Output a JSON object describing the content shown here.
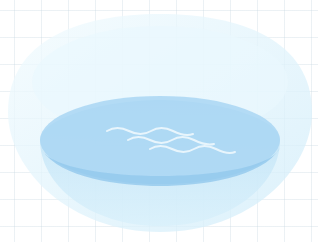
{
  "illustration": {
    "subject": "glass bowl with water",
    "background": "light grid",
    "colors": {
      "background": "#ffffff",
      "grid_line": "#c8d7e1",
      "bowl_glass": "#d6effa",
      "bowl_rim_inner": "#e9f7fd",
      "water_surface": "#a9d6f3",
      "water_band": "#9ccdef",
      "bowl_lower": "#c2e4f7",
      "waves": "#e8f5fc"
    },
    "icons": [
      "bowl-icon",
      "water-icon",
      "wave-icon"
    ]
  }
}
